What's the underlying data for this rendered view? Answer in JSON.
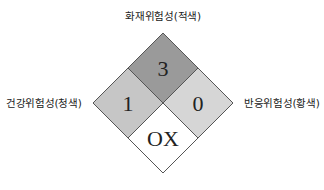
{
  "labels": {
    "top": "화재위험성(적색)",
    "left": "건강위험성(청색)",
    "right": "반응위험성(황색)"
  },
  "diamond": {
    "flammability": {
      "value": "3",
      "color": "#9a9a9a"
    },
    "health": {
      "value": "1",
      "color": "#c6c6c6"
    },
    "reactivity": {
      "value": "0",
      "color": "#d6d6d6"
    },
    "special": {
      "value": "OX",
      "color": "#ffffff"
    }
  }
}
